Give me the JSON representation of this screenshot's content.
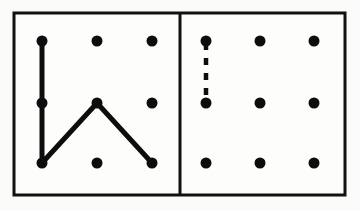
{
  "figure": {
    "background_color": "#f4f4f3",
    "panel_fill": "#fdfdfc",
    "ink_color": "#0d0d0d",
    "border_color": "#111111",
    "border_width": 3,
    "canvas": {
      "width": 360,
      "height": 211
    }
  },
  "frame": {
    "x": 14,
    "y": 13,
    "width": 331,
    "height": 182,
    "divider_x": 180
  },
  "geometry": {
    "dot_radius": 5.5,
    "stroke_width": 5,
    "dash_stroke_width": 4.5,
    "dash_pattern": "7 8",
    "columns_left": [
      42,
      97,
      152
    ],
    "columns_right": [
      206,
      260,
      314
    ],
    "rows": [
      41,
      103,
      163
    ]
  },
  "panels": [
    {
      "id": "left-panel",
      "name": "left-grid-panel",
      "grid": {
        "rows": 3,
        "cols": 3
      },
      "dots": [
        {
          "id": "L-r0c0",
          "cx": 42,
          "cy": 41,
          "row": 0,
          "col": 0
        },
        {
          "id": "L-r0c1",
          "cx": 97,
          "cy": 41,
          "row": 0,
          "col": 1
        },
        {
          "id": "L-r0c2",
          "cx": 152,
          "cy": 41,
          "row": 0,
          "col": 2
        },
        {
          "id": "L-r1c0",
          "cx": 42,
          "cy": 103,
          "row": 1,
          "col": 0
        },
        {
          "id": "L-r1c1",
          "cx": 97,
          "cy": 103,
          "row": 1,
          "col": 1
        },
        {
          "id": "L-r1c2",
          "cx": 152,
          "cy": 103,
          "row": 1,
          "col": 2
        },
        {
          "id": "L-r2c0",
          "cx": 42,
          "cy": 163,
          "row": 2,
          "col": 0
        },
        {
          "id": "L-r2c1",
          "cx": 97,
          "cy": 163,
          "row": 2,
          "col": 1
        },
        {
          "id": "L-r2c2",
          "cx": 152,
          "cy": 163,
          "row": 2,
          "col": 2
        }
      ],
      "paths": [
        {
          "id": "left-zigzag",
          "style": "solid",
          "vertices": [
            "L-r0c0",
            "L-r1c0",
            "L-r2c0",
            "L-r1c1",
            "L-r2c2"
          ],
          "d": "M 42 41 L 42 103 L 42 163 L 97 103 L 152 163"
        }
      ]
    },
    {
      "id": "right-panel",
      "name": "right-grid-panel",
      "grid": {
        "rows": 3,
        "cols": 3
      },
      "dots": [
        {
          "id": "R-r0c0",
          "cx": 206,
          "cy": 41,
          "row": 0,
          "col": 0
        },
        {
          "id": "R-r0c1",
          "cx": 260,
          "cy": 41,
          "row": 0,
          "col": 1
        },
        {
          "id": "R-r0c2",
          "cx": 314,
          "cy": 41,
          "row": 0,
          "col": 2
        },
        {
          "id": "R-r1c0",
          "cx": 206,
          "cy": 103,
          "row": 1,
          "col": 0
        },
        {
          "id": "R-r1c1",
          "cx": 260,
          "cy": 103,
          "row": 1,
          "col": 1
        },
        {
          "id": "R-r1c2",
          "cx": 314,
          "cy": 103,
          "row": 1,
          "col": 2
        },
        {
          "id": "R-r2c0",
          "cx": 206,
          "cy": 163,
          "row": 2,
          "col": 0
        },
        {
          "id": "R-r2c1",
          "cx": 260,
          "cy": 163,
          "row": 2,
          "col": 1
        },
        {
          "id": "R-r2c2",
          "cx": 314,
          "cy": 163,
          "row": 2,
          "col": 2
        }
      ],
      "paths": [
        {
          "id": "right-dashed-segment",
          "style": "dashed",
          "vertices": [
            "R-r0c0",
            "R-r1c0"
          ],
          "d": "M 206 43 L 206 101"
        }
      ]
    }
  ]
}
